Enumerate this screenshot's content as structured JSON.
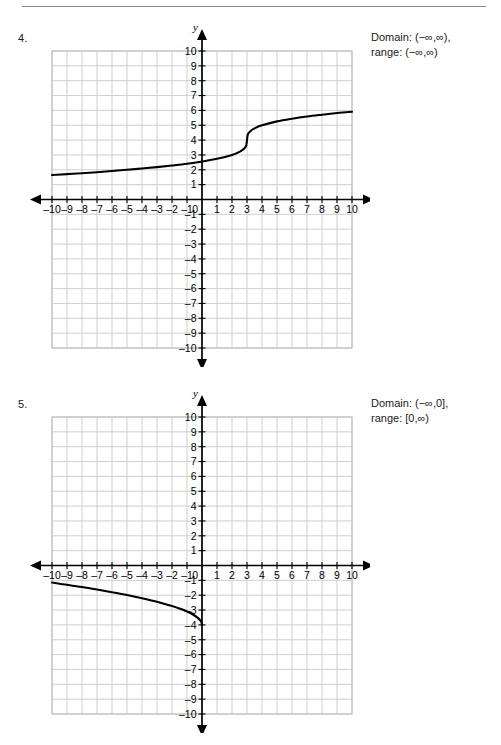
{
  "page": {
    "has_top_rule": true,
    "background": "#ffffff"
  },
  "problems": [
    {
      "number": "4.",
      "answer_lines": [
        "Domain: (−∞,∞),",
        "range: (−∞,∞)"
      ],
      "chart_data": {
        "type": "line",
        "title": "",
        "xlabel": "x",
        "ylabel": "y",
        "xlim": [
          -10,
          10
        ],
        "ylim": [
          -10,
          10
        ],
        "grid": true,
        "grid_step": 1,
        "legend": "none",
        "x_ticks": [
          -10,
          -9,
          -8,
          -7,
          -6,
          -5,
          -4,
          -3,
          -2,
          -1,
          0,
          1,
          2,
          3,
          4,
          5,
          6,
          7,
          8,
          9,
          10
        ],
        "y_ticks": [
          -10,
          -9,
          -8,
          -7,
          -6,
          -5,
          -4,
          -3,
          -2,
          -1,
          0,
          1,
          2,
          3,
          4,
          5,
          6,
          7,
          8,
          9,
          10
        ],
        "x_tick_labels": [
          "–10",
          "–9",
          "–8",
          "–7",
          "–6",
          "–5",
          "–4",
          "–3",
          "–2",
          "–1",
          "0",
          "1",
          "2",
          "3",
          "4",
          "5",
          "6",
          "7",
          "8",
          "9",
          "10"
        ],
        "y_tick_labels": [
          "–10",
          "–9",
          "–8",
          "–7",
          "–6",
          "–5",
          "–4",
          "–3",
          "–2",
          "–1",
          "0",
          "1",
          "2",
          "3",
          "4",
          "5",
          "6",
          "7",
          "8",
          "9",
          "10"
        ],
        "curve_description": "cube root function, inflection point at (3,4)",
        "function": "cbrt(x-3)+4",
        "x": [
          -10,
          -9,
          -8,
          -7,
          -6,
          -5,
          -4,
          -3,
          -2,
          -1,
          0,
          1,
          2,
          2.5,
          2.8,
          2.95,
          3,
          3.05,
          3.2,
          3.5,
          4,
          5,
          6,
          7,
          8,
          9,
          10
        ],
        "y": [
          1.65,
          1.71,
          1.77,
          1.84,
          1.92,
          2.0,
          2.09,
          2.18,
          2.29,
          2.41,
          2.56,
          2.74,
          3.0,
          3.21,
          3.42,
          3.63,
          4.0,
          4.37,
          4.58,
          4.79,
          5.0,
          5.26,
          5.44,
          5.59,
          5.71,
          5.82,
          5.91
        ]
      }
    },
    {
      "number": "5.",
      "answer_lines": [
        "Domain: (−∞,0],",
        "range: [0,∞)"
      ],
      "chart_data": {
        "type": "line",
        "title": "",
        "xlabel": "x",
        "ylabel": "y",
        "xlim": [
          -10,
          10
        ],
        "ylim": [
          -10,
          10
        ],
        "grid": true,
        "grid_step": 1,
        "legend": "none",
        "x_ticks": [
          -10,
          -9,
          -8,
          -7,
          -6,
          -5,
          -4,
          -3,
          -2,
          -1,
          0,
          1,
          2,
          3,
          4,
          5,
          6,
          7,
          8,
          9,
          10
        ],
        "y_ticks": [
          -10,
          -9,
          -8,
          -7,
          -6,
          -5,
          -4,
          -3,
          -2,
          -1,
          0,
          1,
          2,
          3,
          4,
          5,
          6,
          7,
          8,
          9,
          10
        ],
        "x_tick_labels": [
          "–10",
          "–9",
          "–8",
          "–7",
          "–6",
          "–5",
          "–4",
          "–3",
          "–2",
          "–1",
          "0",
          "1",
          "2",
          "3",
          "4",
          "5",
          "6",
          "7",
          "8",
          "9",
          "10"
        ],
        "y_tick_labels": [
          "–10",
          "–9",
          "–8",
          "–7",
          "–6",
          "–5",
          "–4",
          "–3",
          "–2",
          "–1",
          "0",
          "1",
          "2",
          "3",
          "4",
          "5",
          "6",
          "7",
          "8",
          "9",
          "10"
        ],
        "curve_description": "square root reflected, endpoint at (0,-4), extends left and up",
        "function": "-4 + 0.9*sqrt(-x)",
        "x": [
          -10,
          -9.5,
          -9,
          -8,
          -7,
          -6,
          -5,
          -4,
          -3,
          -2,
          -1.5,
          -1,
          -0.6,
          -0.3,
          -0.12,
          -0.04,
          0
        ],
        "y": [
          -1.15,
          -1.23,
          -1.3,
          -1.45,
          -1.62,
          -1.8,
          -1.99,
          -2.2,
          -2.44,
          -2.73,
          -2.9,
          -3.1,
          -3.3,
          -3.51,
          -3.69,
          -3.82,
          -4.0
        ]
      }
    }
  ]
}
